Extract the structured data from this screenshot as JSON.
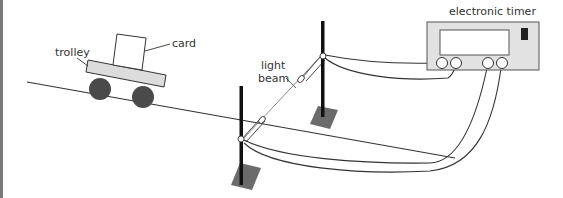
{
  "diagram": {
    "title": "",
    "labels": {
      "trolley": "trolley",
      "card": "card",
      "light_beam_line1": "light",
      "light_beam_line2": "beam",
      "timer": "electronic timer"
    },
    "components": [
      "ramp",
      "trolley",
      "card",
      "light gate pole 1",
      "light gate pole 2",
      "light beam",
      "electronic timer",
      "connecting wires"
    ],
    "colors": {
      "line": "#333333",
      "pole": "#111111",
      "base": "#6b6b6b",
      "trolley_body": "#dcdcdc",
      "wheel": "#4a4a4a",
      "timer_body": "#e2e2e2",
      "timer_display": "#ffffff",
      "timer_indicator": "#222222",
      "frame_border": "#7a7a7a"
    }
  }
}
